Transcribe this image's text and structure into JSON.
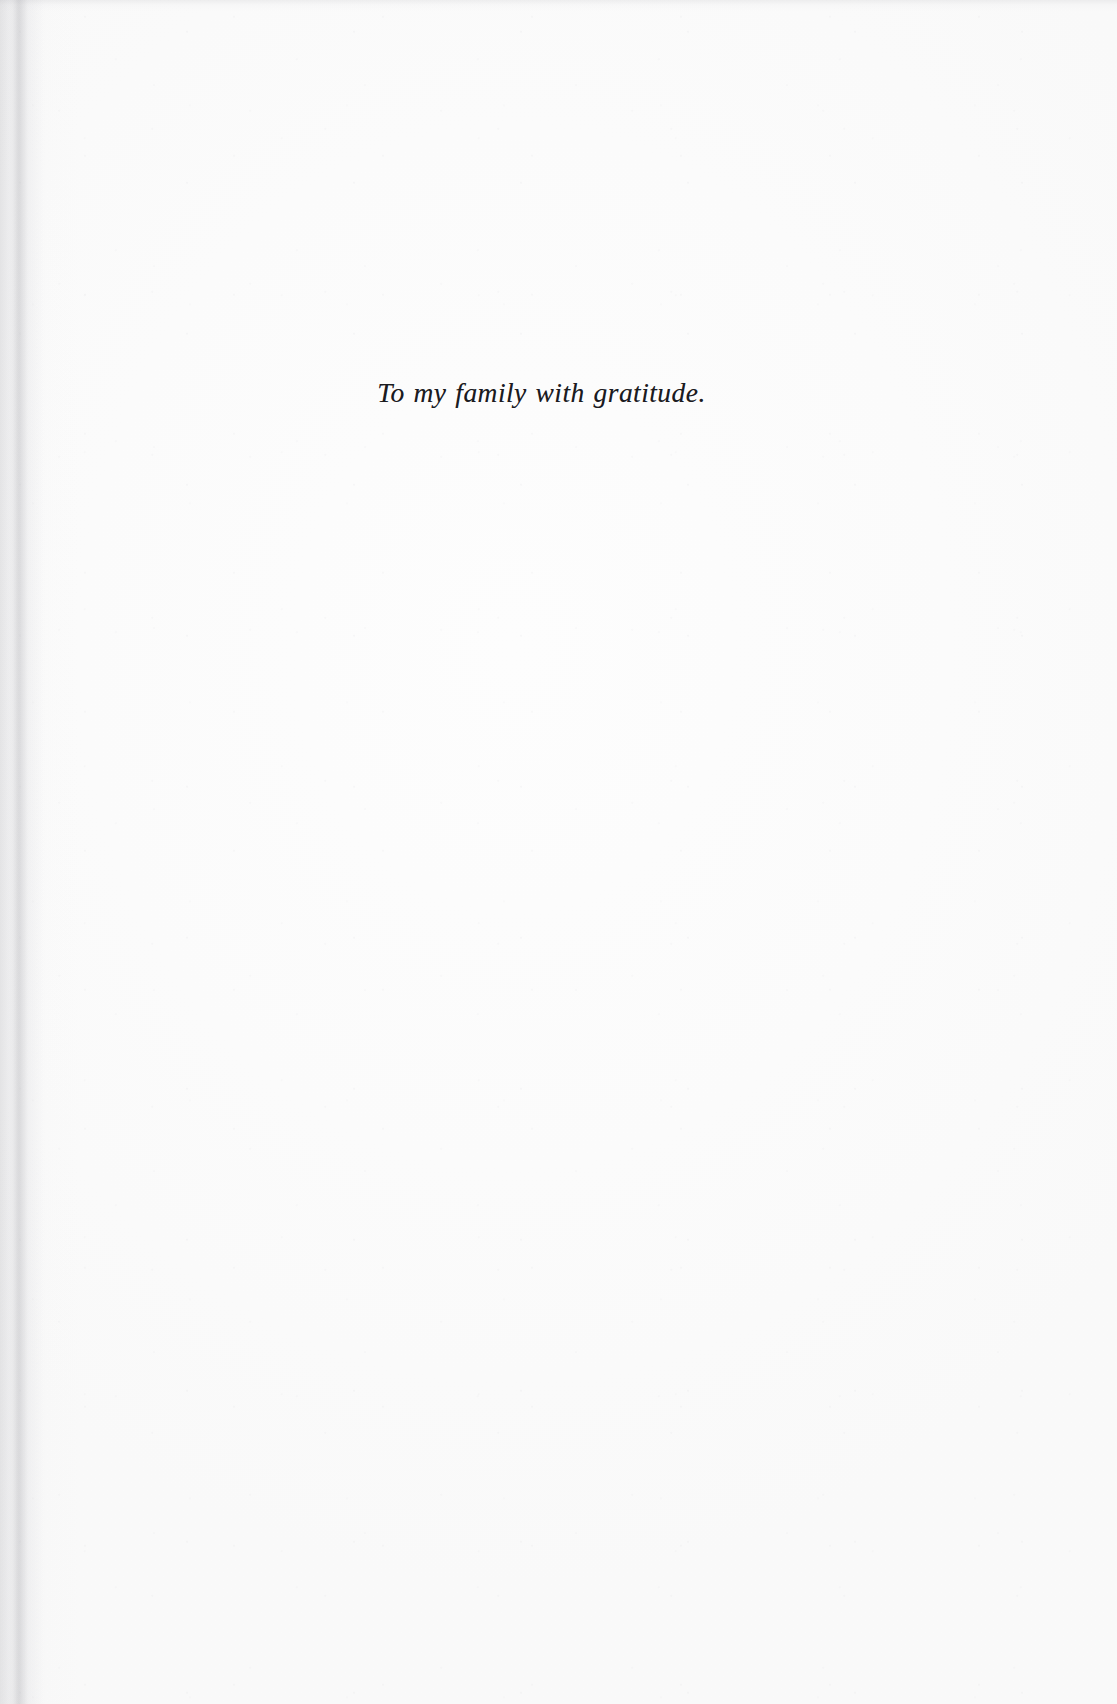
{
  "page": {
    "kind": "book-dedication-page",
    "background_color": "#fdfdfd",
    "ink_color": "#1b1b1f",
    "width": 1117,
    "height": 1704
  },
  "dedication": {
    "text": "To my family with gratitude."
  },
  "artifacts": {
    "gutter_shadow_side": "left",
    "top_edge_scan_noise": true,
    "paper_grain": true
  }
}
